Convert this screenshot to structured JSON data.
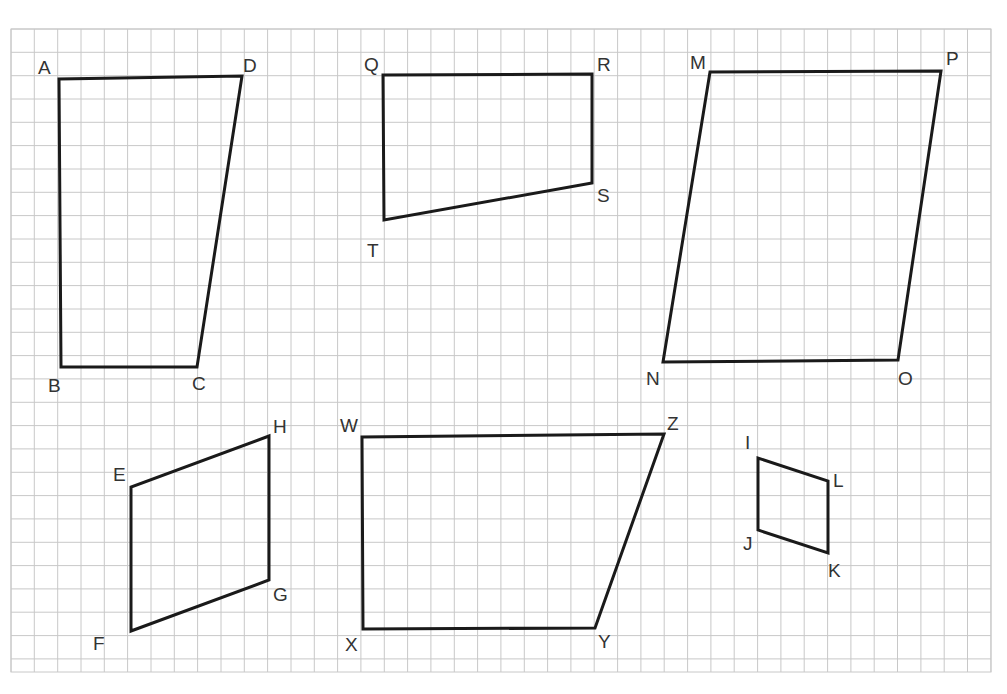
{
  "figure": {
    "background": "#ffffff",
    "grid": {
      "left": 11,
      "top": 29,
      "right": 991,
      "bottom": 672,
      "spacing": 23.33,
      "color": "#c8c8c8"
    },
    "stroke_color": "#1a1a1a",
    "stroke_width": 3
  },
  "shapes": [
    {
      "name": "ABCD",
      "vertices": [
        {
          "label": "A",
          "x": 59,
          "y": 79,
          "lx": 38,
          "ly": 74
        },
        {
          "label": "B",
          "x": 61,
          "y": 367,
          "lx": 48,
          "ly": 392
        },
        {
          "label": "C",
          "x": 197,
          "y": 367,
          "lx": 192,
          "ly": 390
        },
        {
          "label": "D",
          "x": 242,
          "y": 76,
          "lx": 243,
          "ly": 72
        }
      ]
    },
    {
      "name": "QRST",
      "vertices": [
        {
          "label": "Q",
          "x": 383,
          "y": 75,
          "lx": 364,
          "ly": 71
        },
        {
          "label": "R",
          "x": 592,
          "y": 74,
          "lx": 597,
          "ly": 71
        },
        {
          "label": "S",
          "x": 592,
          "y": 183,
          "lx": 597,
          "ly": 202
        },
        {
          "label": "T",
          "x": 384,
          "y": 220,
          "lx": 367,
          "ly": 257
        }
      ]
    },
    {
      "name": "MNOP",
      "vertices": [
        {
          "label": "M",
          "x": 710,
          "y": 72,
          "lx": 690,
          "ly": 69
        },
        {
          "label": "N",
          "x": 663,
          "y": 362,
          "lx": 646,
          "ly": 385
        },
        {
          "label": "O",
          "x": 898,
          "y": 360,
          "lx": 898,
          "ly": 385
        },
        {
          "label": "P",
          "x": 941,
          "y": 71,
          "lx": 946,
          "ly": 65
        }
      ]
    },
    {
      "name": "EFGH",
      "vertices": [
        {
          "label": "E",
          "x": 131,
          "y": 487,
          "lx": 113,
          "ly": 481
        },
        {
          "label": "F",
          "x": 131,
          "y": 631,
          "lx": 93,
          "ly": 650
        },
        {
          "label": "G",
          "x": 269,
          "y": 580,
          "lx": 273,
          "ly": 601
        },
        {
          "label": "H",
          "x": 269,
          "y": 436,
          "lx": 273,
          "ly": 433
        }
      ]
    },
    {
      "name": "WXYZ",
      "vertices": [
        {
          "label": "W",
          "x": 362,
          "y": 437,
          "lx": 340,
          "ly": 432
        },
        {
          "label": "X",
          "x": 363,
          "y": 629,
          "lx": 345,
          "ly": 651
        },
        {
          "label": "Y",
          "x": 595,
          "y": 628,
          "lx": 598,
          "ly": 648
        },
        {
          "label": "Z",
          "x": 664,
          "y": 434,
          "lx": 667,
          "ly": 430
        }
      ]
    },
    {
      "name": "IJKL",
      "vertices": [
        {
          "label": "I",
          "x": 758,
          "y": 458,
          "lx": 745,
          "ly": 449
        },
        {
          "label": "J",
          "x": 758,
          "y": 530,
          "lx": 743,
          "ly": 550
        },
        {
          "label": "K",
          "x": 828,
          "y": 553,
          "lx": 828,
          "ly": 577
        },
        {
          "label": "L",
          "x": 828,
          "y": 481,
          "lx": 833,
          "ly": 487
        }
      ]
    }
  ]
}
